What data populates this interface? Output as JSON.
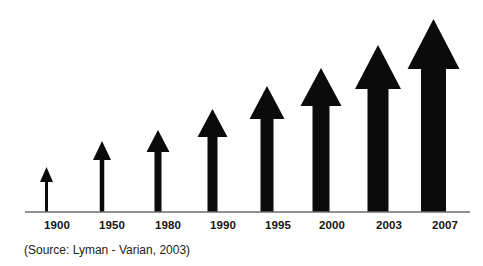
{
  "chart_data": {
    "type": "bar",
    "title": "",
    "subtitle": "",
    "xlabel": "",
    "ylabel": "",
    "grid": false,
    "legend": false,
    "orientation": "vertical",
    "marker_style": "upward-arrow",
    "categories": [
      "1900",
      "1950",
      "1980",
      "1990",
      "1995",
      "2000",
      "2003",
      "2007"
    ],
    "values": [
      45,
      70,
      81,
      102,
      125,
      143,
      166,
      192
    ],
    "value_units": "relative arrow height (px)",
    "ylim": [
      0,
      200
    ],
    "series": [
      {
        "name": "Information growth",
        "values": [
          45,
          70,
          81,
          102,
          125,
          143,
          166,
          192
        ]
      }
    ],
    "annotations": [
      "(Source: Lyman - Varian, 2003)"
    ],
    "colors": {
      "arrow": "#0b0b0b",
      "axis": "#6d6d6d",
      "label": "#141414",
      "background": "#ffffff"
    }
  },
  "chart": {
    "background_color": "#ffffff",
    "arrow_color": "#0b0b0b",
    "axis_color": "#6d6d6d",
    "baseline_y": 212,
    "axis_start_x": 25,
    "axis_end_x": 470,
    "arrows": [
      {
        "year": "1900",
        "label_x": 57,
        "center_x": 46.5,
        "tip_y": 167,
        "shaft_width": 3,
        "head_width": 13,
        "head_height": 15
      },
      {
        "year": "1950",
        "label_x": 112,
        "center_x": 102,
        "tip_y": 141,
        "shaft_width": 4.5,
        "head_width": 18,
        "head_height": 19
      },
      {
        "year": "1980",
        "label_x": 168,
        "center_x": 158,
        "tip_y": 130,
        "shaft_width": 7,
        "head_width": 23,
        "head_height": 22
      },
      {
        "year": "1990",
        "label_x": 223,
        "center_x": 212.5,
        "tip_y": 109,
        "shaft_width": 10,
        "head_width": 30,
        "head_height": 28
      },
      {
        "year": "1995",
        "label_x": 278,
        "center_x": 267,
        "tip_y": 86,
        "shaft_width": 13,
        "head_width": 35,
        "head_height": 33
      },
      {
        "year": "2000",
        "label_x": 332,
        "center_x": 321,
        "tip_y": 68,
        "shaft_width": 17,
        "head_width": 41,
        "head_height": 38
      },
      {
        "year": "2003",
        "label_x": 389,
        "center_x": 378,
        "tip_y": 45,
        "shaft_width": 21,
        "head_width": 46,
        "head_height": 44
      },
      {
        "year": "2007",
        "label_x": 445,
        "center_x": 433.5,
        "tip_y": 19,
        "shaft_width": 25,
        "head_width": 52,
        "head_height": 50
      }
    ],
    "year_label_y": 229,
    "source": {
      "text": "(Source: Lyman - Varian, 2003)",
      "x": 24,
      "y": 254
    }
  }
}
